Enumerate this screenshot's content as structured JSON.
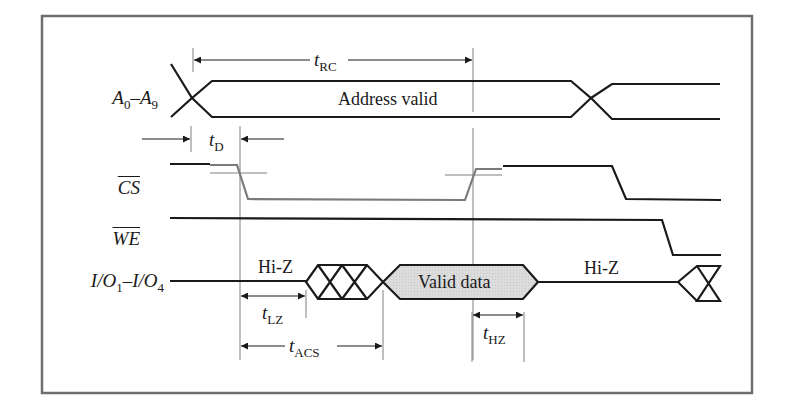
{
  "diagram": {
    "type": "timing-diagram",
    "colors": {
      "frame": "#6e6e6e",
      "signal": "#1a1a1a",
      "cs_transition": "#7a7a7a",
      "guide": "#808080",
      "valid_data_fill": "#d9d9d9",
      "background": "#ffffff"
    },
    "signals": [
      {
        "id": "address",
        "name": "A",
        "sub1": "0",
        "sep": "–",
        "name2": "A",
        "sub2": "9",
        "label_text": "Address valid"
      },
      {
        "id": "cs",
        "name": "CS",
        "active_low": true
      },
      {
        "id": "we",
        "name": "WE",
        "active_low": true
      },
      {
        "id": "io",
        "name": "I/O",
        "sub1": "1",
        "sep": "–",
        "name2": "I/O",
        "sub2": "4",
        "states": [
          "Hi-Z",
          "Valid data",
          "Hi-Z"
        ]
      }
    ],
    "timing_params": [
      {
        "id": "t_rc",
        "t": "t",
        "sub": "RC"
      },
      {
        "id": "t_d",
        "t": "t",
        "sub": "D"
      },
      {
        "id": "t_lz",
        "t": "t",
        "sub": "LZ"
      },
      {
        "id": "t_acs",
        "t": "t",
        "sub": "ACS"
      },
      {
        "id": "t_hz",
        "t": "t",
        "sub": "HZ"
      }
    ],
    "labels": {
      "address_valid": "Address valid",
      "hi_z_1": "Hi-Z",
      "valid_data": "Valid data",
      "hi_z_2": "Hi-Z"
    }
  }
}
